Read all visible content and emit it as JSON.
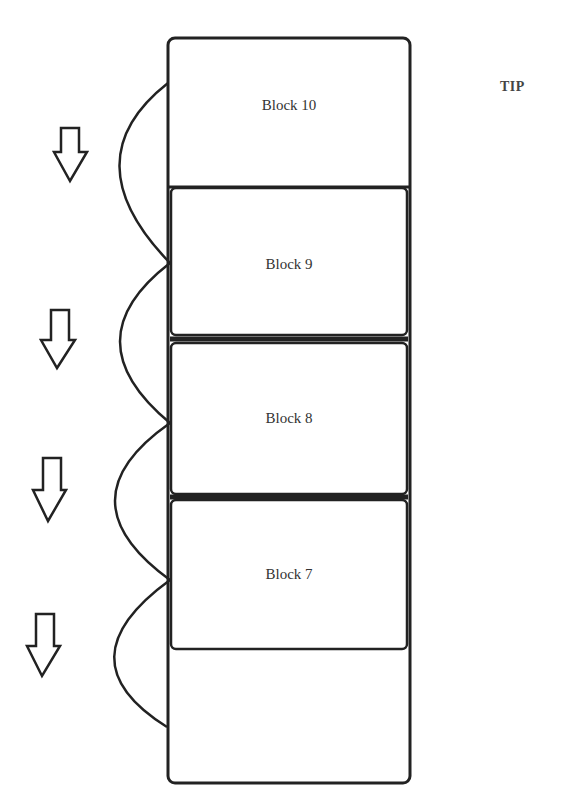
{
  "diagram": {
    "tip_label": "TIP",
    "blocks": [
      {
        "label": "Block 10"
      },
      {
        "label": "Block 9"
      },
      {
        "label": "Block 8"
      },
      {
        "label": "Block 7"
      },
      {
        "label": ""
      }
    ],
    "arrows": [
      "down-arrow",
      "down-arrow",
      "down-arrow",
      "down-arrow"
    ],
    "stroke_color": "#222222"
  }
}
